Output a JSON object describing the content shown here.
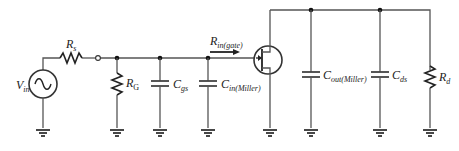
{
  "diagram": {
    "components": [
      {
        "id": "vin",
        "type": "ac-source",
        "label": "V",
        "sub": "in"
      },
      {
        "id": "rs",
        "type": "resistor",
        "label": "R",
        "sub": "s"
      },
      {
        "id": "rg",
        "type": "resistor",
        "label": "R",
        "sub": "G"
      },
      {
        "id": "cgs",
        "type": "capacitor",
        "label": "C",
        "sub": "gs"
      },
      {
        "id": "cin_miller",
        "type": "capacitor",
        "label": "C",
        "sub": "in(Miller)"
      },
      {
        "id": "jfet",
        "type": "n-channel-jfet",
        "label": ""
      },
      {
        "id": "cout_miller",
        "type": "capacitor",
        "label": "C",
        "sub": "out(Miller)"
      },
      {
        "id": "cds",
        "type": "capacitor",
        "label": "C",
        "sub": "ds"
      },
      {
        "id": "rd",
        "type": "resistor",
        "label": "R",
        "sub": "d"
      }
    ],
    "annotations": [
      {
        "id": "rin_gate",
        "type": "arrow",
        "label": "R",
        "sub": "in(gate)"
      }
    ],
    "ground_count": 8
  },
  "labels": {
    "vin": {
      "main": "V",
      "sub": "in"
    },
    "rs": {
      "main": "R",
      "sub": "s"
    },
    "rg": {
      "main": "R",
      "sub": "G"
    },
    "cgs": {
      "main": "C",
      "sub": "gs"
    },
    "cin": {
      "main": "C",
      "sub": "in(Miller)"
    },
    "rin": {
      "main": "R",
      "sub": "in(gate)"
    },
    "cout": {
      "main": "C",
      "sub": "out(Miller)"
    },
    "cds": {
      "main": "C",
      "sub": "ds"
    },
    "rd": {
      "main": "R",
      "sub": "d"
    }
  }
}
